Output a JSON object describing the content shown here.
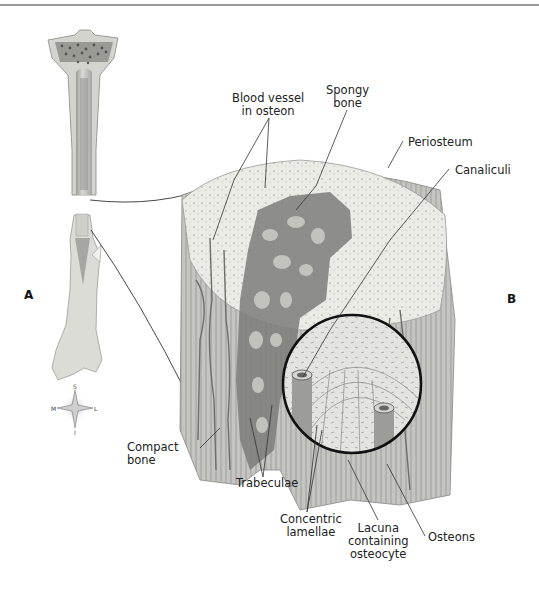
{
  "figure": {
    "panels": [
      {
        "id": "A",
        "label": "A"
      },
      {
        "id": "B",
        "label": "B"
      }
    ],
    "labels": {
      "blood_vessel": [
        "Blood vessel",
        "in osteon"
      ],
      "spongy_bone": [
        "Spongy",
        "bone"
      ],
      "periosteum": "Periosteum",
      "canaliculi": "Canaliculi",
      "compact_bone": [
        "Compact",
        "bone"
      ],
      "trabeculae": "Trabeculae",
      "concentric_lamellae": [
        "Concentric",
        "lamellae"
      ],
      "lacuna": [
        "Lacuna",
        "containing",
        "osteocyte"
      ],
      "osteons": "Osteons"
    },
    "compass": {
      "superior": "S",
      "inferior": "I",
      "medial": "M",
      "lateral": "L"
    },
    "colors": {
      "line": "#333333",
      "bone_light": "#e6e6e2",
      "bone_mid": "#bdbdb8",
      "bone_dark": "#7a7a76",
      "spongy_dark": "#6d6d6a",
      "lens_border": "#111111"
    }
  }
}
